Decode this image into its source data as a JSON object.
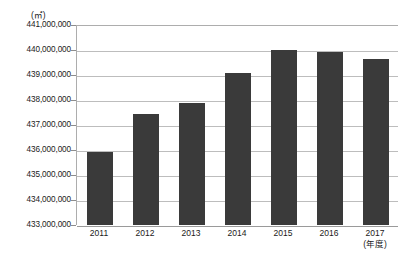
{
  "top_caption": "",
  "axis": {
    "unit_label": "(㎡)",
    "x_unit_note": "(年度)"
  },
  "chart_data": {
    "type": "bar",
    "title": "",
    "subtitle": "",
    "xlabel": "",
    "ylabel": "",
    "unit": "㎡",
    "x_unit_note": "(年度)",
    "categories": [
      "2011",
      "2012",
      "2013",
      "2014",
      "2015",
      "2016",
      "2017"
    ],
    "values": [
      435920000,
      437440000,
      437880000,
      439080000,
      440000000,
      439920000,
      439650000
    ],
    "ylim": [
      433000000,
      441000000
    ],
    "ytick_labels": [
      "441,000,000",
      "440,000,000",
      "439,000,000",
      "438,000,000",
      "437,000,000",
      "436,000,000",
      "435,000,000",
      "434,000,000",
      "433,000,000"
    ],
    "ytick_values": [
      441000000,
      440000000,
      439000000,
      438000000,
      437000000,
      436000000,
      435000000,
      434000000,
      433000000
    ],
    "grid": true,
    "legend": false,
    "legend_position": "none",
    "series": [
      {
        "name": "",
        "color": "#3a3a3a",
        "values": [
          435920000,
          437440000,
          437880000,
          439080000,
          440000000,
          439920000,
          439650000
        ]
      }
    ]
  },
  "colors": {
    "bar": "#3a3a3a",
    "grid": "#bdbdbd",
    "axis": "#adadad",
    "background": "#ffffff",
    "text": "#1a1a1a"
  }
}
